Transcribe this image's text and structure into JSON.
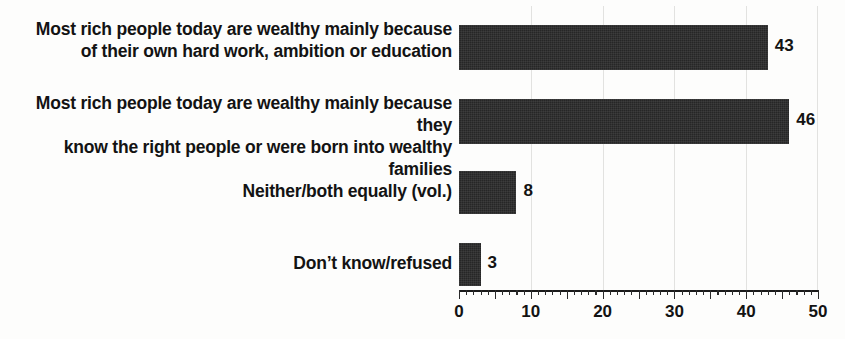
{
  "chart_data": {
    "type": "bar",
    "orientation": "horizontal",
    "title": "",
    "subtitle": "",
    "xlabel": "",
    "ylabel": "",
    "xlim": [
      0,
      50
    ],
    "xticks": [
      0,
      10,
      20,
      30,
      40,
      50
    ],
    "xtick_labels": [
      "0",
      "10",
      "20",
      "30",
      "40",
      "50"
    ],
    "minor_tick_step": 1,
    "major_tick_step": 5,
    "grid": "vertical-light",
    "legend": "none",
    "bar_color": "#262626",
    "background_color": "#fdfdfc",
    "text_color": "#131313",
    "categories": [
      "Most rich people today are wealthy mainly because\nof their own hard work, ambition or education",
      "Most rich people today are wealthy mainly because they\nknow the right people or were born into wealthy families",
      "Neither/both equally (vol.)",
      "Don’t know/refused"
    ],
    "values": [
      43,
      46,
      8,
      3
    ],
    "value_labels": [
      "43",
      "46",
      "8",
      "3"
    ]
  },
  "chart": {
    "bars": [
      {
        "label": "Most rich people today are wealthy mainly because\nof their own hard work, ambition or education",
        "value": 43,
        "value_label": "43"
      },
      {
        "label": "Most rich people today are wealthy mainly because they\nknow the right people or were born into wealthy families",
        "value": 46,
        "value_label": "46"
      },
      {
        "label": "Neither/both equally (vol.)",
        "value": 8,
        "value_label": "8"
      },
      {
        "label": "Don’t know/refused",
        "value": 3,
        "value_label": "3"
      }
    ],
    "axis": {
      "tick_labels": [
        "0",
        "10",
        "20",
        "30",
        "40",
        "50"
      ]
    }
  }
}
